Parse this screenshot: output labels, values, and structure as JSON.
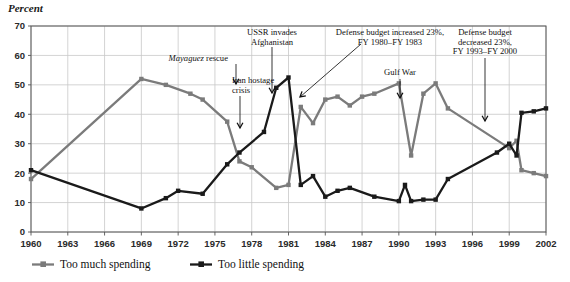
{
  "chart_data": {
    "type": "line",
    "title": "",
    "ylabel": "Percent",
    "xlabel": "",
    "ylim": [
      0,
      70
    ],
    "ytick_step": 10,
    "yticks": [
      "0",
      "10",
      "20",
      "30",
      "40",
      "50",
      "60",
      "70"
    ],
    "xlim": [
      1960,
      2002
    ],
    "xtick_step": 3,
    "xticks": [
      "1960",
      "1963",
      "1966",
      "1969",
      "1972",
      "1975",
      "1978",
      "1981",
      "1984",
      "1987",
      "1990",
      "1993",
      "1996",
      "1999",
      "2002"
    ],
    "grid": true,
    "legend_position": "bottom-left",
    "colors": {
      "too_much": "#7b7b7b",
      "too_little": "#1a1a1a",
      "grid": "#c8c8c8",
      "frame": "#555555",
      "annotation": "#111111"
    },
    "series": [
      {
        "name": "Too much spending",
        "color": "#7b7b7b",
        "marker": "square",
        "points": [
          {
            "x": 1960,
            "y": 18
          },
          {
            "x": 1969,
            "y": 52
          },
          {
            "x": 1971,
            "y": 50
          },
          {
            "x": 1973,
            "y": 47
          },
          {
            "x": 1974,
            "y": 45
          },
          {
            "x": 1976,
            "y": 37.5
          },
          {
            "x": 1977,
            "y": 24
          },
          {
            "x": 1978,
            "y": 22
          },
          {
            "x": 1980,
            "y": 15
          },
          {
            "x": 1981,
            "y": 16
          },
          {
            "x": 1982,
            "y": 42.5
          },
          {
            "x": 1983,
            "y": 37
          },
          {
            "x": 1984,
            "y": 45
          },
          {
            "x": 1985,
            "y": 46
          },
          {
            "x": 1986,
            "y": 43
          },
          {
            "x": 1987,
            "y": 46
          },
          {
            "x": 1988,
            "y": 47
          },
          {
            "x": 1990,
            "y": 50.5
          },
          {
            "x": 1991,
            "y": 26
          },
          {
            "x": 1992,
            "y": 47
          },
          {
            "x": 1993,
            "y": 50.5
          },
          {
            "x": 1994,
            "y": 42
          },
          {
            "x": 1999,
            "y": 28.5
          },
          {
            "x": 1999.6,
            "y": 31
          },
          {
            "x": 2000,
            "y": 21
          },
          {
            "x": 2001,
            "y": 20
          },
          {
            "x": 2002,
            "y": 19
          }
        ]
      },
      {
        "name": "Too little spending",
        "color": "#1a1a1a",
        "marker": "square",
        "points": [
          {
            "x": 1960,
            "y": 21
          },
          {
            "x": 1969,
            "y": 8
          },
          {
            "x": 1971,
            "y": 11.5
          },
          {
            "x": 1972,
            "y": 14
          },
          {
            "x": 1974,
            "y": 13
          },
          {
            "x": 1976,
            "y": 23
          },
          {
            "x": 1977,
            "y": 27
          },
          {
            "x": 1979,
            "y": 34
          },
          {
            "x": 1980,
            "y": 49
          },
          {
            "x": 1981,
            "y": 52.5
          },
          {
            "x": 1982,
            "y": 16
          },
          {
            "x": 1983,
            "y": 19
          },
          {
            "x": 1984,
            "y": 12
          },
          {
            "x": 1985,
            "y": 14
          },
          {
            "x": 1986,
            "y": 15
          },
          {
            "x": 1988,
            "y": 12
          },
          {
            "x": 1990,
            "y": 10.5
          },
          {
            "x": 1990.5,
            "y": 16
          },
          {
            "x": 1991,
            "y": 10.5
          },
          {
            "x": 1992,
            "y": 11
          },
          {
            "x": 1993,
            "y": 11
          },
          {
            "x": 1994,
            "y": 18
          },
          {
            "x": 1998,
            "y": 27
          },
          {
            "x": 1999,
            "y": 30
          },
          {
            "x": 1999.6,
            "y": 26
          },
          {
            "x": 2000,
            "y": 40.5
          },
          {
            "x": 2001,
            "y": 41
          },
          {
            "x": 2002,
            "y": 42
          }
        ]
      }
    ],
    "annotations": [
      {
        "id": "mayaguez-rescue",
        "lines": [
          {
            "text": "Mayaguez",
            "italic": true
          },
          {
            "text": " rescue",
            "italic": false
          }
        ],
        "text": "Mayaguez rescue",
        "text_x": 228,
        "text_y": 61,
        "anchor": "end",
        "arrow": {
          "x1": 236,
          "y1": 64,
          "x2": 236,
          "y2": 84
        }
      },
      {
        "id": "iran-hostage-crisis",
        "lines": [
          {
            "text": "Iran hostage",
            "italic": false
          },
          {
            "text": "crisis",
            "italic": false
          }
        ],
        "text": "Iran hostage crisis",
        "text_x": 232,
        "text_y": 83,
        "anchor": "start",
        "arrow": {
          "x1": 240,
          "y1": 96,
          "x2": 240,
          "y2": 128
        }
      },
      {
        "id": "ussr-invades-afghanistan",
        "lines": [
          {
            "text": "USSR invades",
            "italic": false
          },
          {
            "text": "Afghanistan",
            "italic": false
          }
        ],
        "text": "USSR invades Afghanistan",
        "text_x": 272,
        "text_y": 35,
        "anchor": "middle",
        "arrow": {
          "x1": 272,
          "y1": 47,
          "x2": 272,
          "y2": 93
        }
      },
      {
        "id": "defense-budget-increased",
        "lines": [
          {
            "text": "Defense budget increased 23%,",
            "italic": false
          },
          {
            "text": "FY 1980–FY 1983",
            "italic": false
          }
        ],
        "text": "Defense budget increased 23%, FY 1980–FY 1983",
        "text_x": 390,
        "text_y": 35,
        "anchor": "middle",
        "arrow": {
          "x1": 361,
          "y1": 44,
          "x2": 300,
          "y2": 97
        }
      },
      {
        "id": "gulf-war",
        "lines": [
          {
            "text": "Gulf War",
            "italic": false
          }
        ],
        "text": "Gulf War",
        "text_x": 400,
        "text_y": 75,
        "anchor": "middle",
        "arrow": {
          "x1": 400,
          "y1": 79,
          "x2": 400,
          "y2": 98
        }
      },
      {
        "id": "defense-budget-decreased",
        "lines": [
          {
            "text": "Defense budget",
            "italic": false
          },
          {
            "text": "decreased 23%,",
            "italic": false
          },
          {
            "text": "FY 1993–FY 2000",
            "italic": false
          }
        ],
        "text": "Defense budget decreased 23%, FY 1993–FY 2000",
        "text_x": 485,
        "text_y": 35,
        "anchor": "middle",
        "arrow": {
          "x1": 485,
          "y1": 58,
          "x2": 485,
          "y2": 121
        }
      }
    ],
    "legend": [
      {
        "label": "Too much spending",
        "color": "#7b7b7b"
      },
      {
        "label": "Too little spending",
        "color": "#1a1a1a"
      }
    ]
  }
}
